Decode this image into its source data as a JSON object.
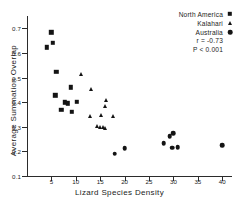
{
  "chart_data": {
    "type": "scatter",
    "title": "",
    "xlabel": "Lizard Species Density",
    "ylabel": "Average Summation Overlap",
    "xlim": [
      0,
      42
    ],
    "ylim": [
      0.1,
      0.75
    ],
    "xticks": [
      5,
      10,
      15,
      20,
      25,
      30,
      35,
      40
    ],
    "xtick_labels": [
      "5",
      "10",
      "15",
      "20",
      "25",
      "30",
      "35",
      "40"
    ],
    "yticks": [
      0.1,
      0.2,
      0.3,
      0.4,
      0.5,
      0.6,
      0.7
    ],
    "ytick_labels": [
      "0.1",
      "0.2",
      "0.3",
      "0.4",
      "0.5",
      "0.6",
      "0.7"
    ],
    "grid": false,
    "legend_position": "top-right",
    "annotations": [
      "r = -0.73",
      "P < 0.001"
    ],
    "series": [
      {
        "name": "North America",
        "marker": "square",
        "color": "#141414",
        "points": [
          {
            "x": 4.0,
            "y": 0.623
          },
          {
            "x": 5.0,
            "y": 0.684
          },
          {
            "x": 5.3,
            "y": 0.642
          },
          {
            "x": 6.0,
            "y": 0.523
          },
          {
            "x": 5.8,
            "y": 0.428
          },
          {
            "x": 7.0,
            "y": 0.37
          },
          {
            "x": 7.8,
            "y": 0.399
          },
          {
            "x": 8.4,
            "y": 0.396
          },
          {
            "x": 9.0,
            "y": 0.46
          },
          {
            "x": 9.2,
            "y": 0.362
          },
          {
            "x": 10.2,
            "y": 0.401
          }
        ]
      },
      {
        "name": "Kalahari",
        "marker": "triangle",
        "color": "#141414",
        "points": [
          {
            "x": 11.0,
            "y": 0.516
          },
          {
            "x": 13.2,
            "y": 0.455
          },
          {
            "x": 13.0,
            "y": 0.345
          },
          {
            "x": 14.4,
            "y": 0.303
          },
          {
            "x": 15.0,
            "y": 0.299
          },
          {
            "x": 15.2,
            "y": 0.346
          },
          {
            "x": 15.6,
            "y": 0.298
          },
          {
            "x": 16.0,
            "y": 0.297
          },
          {
            "x": 16.0,
            "y": 0.385
          },
          {
            "x": 16.1,
            "y": 0.41
          },
          {
            "x": 17.6,
            "y": 0.344
          }
        ]
      },
      {
        "name": "Australia",
        "marker": "circle",
        "color": "#141414",
        "points": [
          {
            "x": 18.0,
            "y": 0.191
          },
          {
            "x": 20.0,
            "y": 0.214
          },
          {
            "x": 28.0,
            "y": 0.234
          },
          {
            "x": 29.2,
            "y": 0.261
          },
          {
            "x": 30.0,
            "y": 0.273
          },
          {
            "x": 29.8,
            "y": 0.215
          },
          {
            "x": 30.9,
            "y": 0.217
          },
          {
            "x": 40.0,
            "y": 0.226
          }
        ]
      }
    ]
  },
  "legend": {
    "entries": [
      {
        "label": "North America",
        "marker": "square-marker"
      },
      {
        "label": "Kalahari",
        "marker": "triangle-marker"
      },
      {
        "label": "Australia",
        "marker": "circle-marker"
      }
    ],
    "stats": [
      "r = -0.73",
      "P < 0.001"
    ]
  }
}
